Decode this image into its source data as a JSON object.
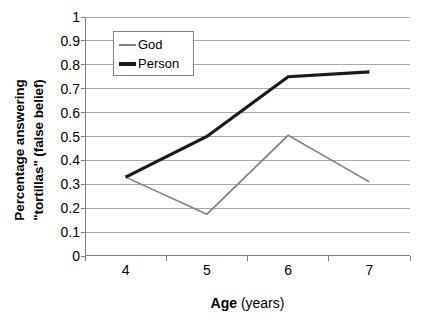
{
  "chart_data": {
    "type": "line",
    "title": "",
    "xlabel": "Age (years)",
    "xlabel_bold_part": "Age",
    "xlabel_plain_part": " (years)",
    "ylabel_line1": "Percentage answering",
    "ylabel_line2": "\"tortillas\" (false belief)",
    "categories": [
      "4",
      "5",
      "6",
      "7"
    ],
    "ylim": [
      0,
      1
    ],
    "ytick_step": 0.1,
    "ytick_labels": [
      "1",
      "0.9",
      "0.8",
      "0.7",
      "0.6",
      "0.5",
      "0.4",
      "0.3",
      "0.2",
      "0.1",
      "0"
    ],
    "ytick_values": [
      1,
      0.9,
      0.8,
      0.7,
      0.6,
      0.5,
      0.4,
      0.3,
      0.2,
      0.1,
      0
    ],
    "grid": "horizontal",
    "legend_position": "upper-left-inside",
    "series": [
      {
        "name": "God",
        "values": [
          0.33,
          0.175,
          0.505,
          0.31
        ],
        "color": "#808080",
        "width": 1.6
      },
      {
        "name": "Person",
        "values": [
          0.33,
          0.5,
          0.75,
          0.77
        ],
        "color": "#1a1a1a",
        "width": 3.2
      }
    ],
    "colors": {
      "background": "#ffffff",
      "gridline": "#a6a6a6",
      "axis": "#808080",
      "text": "#000000",
      "legend_border": "#808080"
    }
  }
}
